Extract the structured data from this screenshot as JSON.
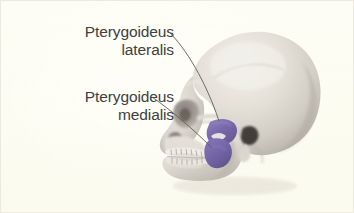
{
  "figure": {
    "kind": "anatomical-illustration",
    "background_color": "#fdfcf3",
    "border_color": "#eceade",
    "text_color": "#3f3f42",
    "leader_line_color": "#5e5c58",
    "bone_color_light": "#e8e4dd",
    "bone_color_mid": "#cfc9c2",
    "bone_color_shadow": "#9a9views",
    "muscle_highlight_color": "#6f5fa6"
  },
  "labels": [
    {
      "id": "pterygoideus-lateralis",
      "line1": "Pterygoideus",
      "line2": "lateralis",
      "points_to": "lateral-pterygoid-muscle"
    },
    {
      "id": "pterygoideus-medialis",
      "line1": "Pterygoideus",
      "line2": "medialis",
      "points_to": "medial-pterygoid-muscle"
    }
  ],
  "highlighted_structures": [
    {
      "name": "lateral-pterygoid-muscle",
      "color": "#6f5fa6"
    },
    {
      "name": "medial-pterygoid-muscle",
      "color": "#6f5fa6"
    }
  ],
  "skull_features": [
    "cranium",
    "frontal-bone",
    "orbit",
    "nasal-aperture",
    "zygomatic-arch",
    "maxilla",
    "upper-teeth",
    "lower-teeth",
    "mandible",
    "mandibular-ramus",
    "external-acoustic-meatus",
    "mastoid-process",
    "occipital-region"
  ]
}
